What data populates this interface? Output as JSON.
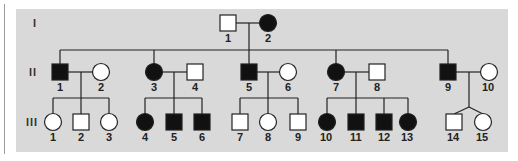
{
  "diagram": {
    "type": "pedigree",
    "colors": {
      "background": "#d9d9d9",
      "affected": "#111111",
      "unaffected": "#ffffff",
      "line": "#222222"
    },
    "generations": [
      {
        "label": "I",
        "y": 23
      },
      {
        "label": "II",
        "y": 72
      },
      {
        "label": "III",
        "y": 122
      }
    ],
    "individuals": [
      {
        "id": "I-1",
        "label": "1",
        "sex": "male",
        "affected": false,
        "x": 228,
        "y": 23
      },
      {
        "id": "I-2",
        "label": "2",
        "sex": "female",
        "affected": true,
        "x": 268,
        "y": 23
      },
      {
        "id": "II-1",
        "label": "1",
        "sex": "male",
        "affected": true,
        "x": 60,
        "y": 72
      },
      {
        "id": "II-2",
        "label": "2",
        "sex": "female",
        "affected": false,
        "x": 101,
        "y": 72
      },
      {
        "id": "II-3",
        "label": "3",
        "sex": "female",
        "affected": true,
        "x": 154,
        "y": 72
      },
      {
        "id": "II-4",
        "label": "4",
        "sex": "male",
        "affected": false,
        "x": 195,
        "y": 72
      },
      {
        "id": "II-5",
        "label": "5",
        "sex": "male",
        "affected": true,
        "x": 249,
        "y": 72
      },
      {
        "id": "II-6",
        "label": "6",
        "sex": "female",
        "affected": false,
        "x": 288,
        "y": 72
      },
      {
        "id": "II-7",
        "label": "7",
        "sex": "female",
        "affected": true,
        "x": 336,
        "y": 72
      },
      {
        "id": "II-8",
        "label": "8",
        "sex": "male",
        "affected": false,
        "x": 377,
        "y": 72
      },
      {
        "id": "II-9",
        "label": "9",
        "sex": "male",
        "affected": true,
        "x": 448,
        "y": 72
      },
      {
        "id": "II-10",
        "label": "10",
        "sex": "female",
        "affected": false,
        "x": 489,
        "y": 72
      },
      {
        "id": "III-1",
        "label": "1",
        "sex": "female",
        "affected": false,
        "x": 53,
        "y": 122
      },
      {
        "id": "III-2",
        "label": "2",
        "sex": "male",
        "affected": false,
        "x": 81,
        "y": 122
      },
      {
        "id": "III-3",
        "label": "3",
        "sex": "female",
        "affected": false,
        "x": 109,
        "y": 122
      },
      {
        "id": "III-4",
        "label": "4",
        "sex": "female",
        "affected": true,
        "x": 145,
        "y": 122
      },
      {
        "id": "III-5",
        "label": "5",
        "sex": "male",
        "affected": true,
        "x": 174,
        "y": 122
      },
      {
        "id": "III-6",
        "label": "6",
        "sex": "male",
        "affected": true,
        "x": 202,
        "y": 122
      },
      {
        "id": "III-7",
        "label": "7",
        "sex": "male",
        "affected": false,
        "x": 240,
        "y": 122
      },
      {
        "id": "III-8",
        "label": "8",
        "sex": "female",
        "affected": false,
        "x": 268,
        "y": 122
      },
      {
        "id": "III-9",
        "label": "9",
        "sex": "male",
        "affected": false,
        "x": 298,
        "y": 122
      },
      {
        "id": "III-10",
        "label": "10",
        "sex": "female",
        "affected": true,
        "x": 327,
        "y": 122
      },
      {
        "id": "III-11",
        "label": "11",
        "sex": "male",
        "affected": true,
        "x": 356,
        "y": 122
      },
      {
        "id": "III-12",
        "label": "12",
        "sex": "male",
        "affected": true,
        "x": 384,
        "y": 122
      },
      {
        "id": "III-13",
        "label": "13",
        "sex": "female",
        "affected": true,
        "x": 408,
        "y": 122
      },
      {
        "id": "III-14",
        "label": "14",
        "sex": "male",
        "affected": false,
        "x": 454,
        "y": 122
      },
      {
        "id": "III-15",
        "label": "15",
        "sex": "female",
        "affected": false,
        "x": 483,
        "y": 122
      }
    ],
    "matings": [
      {
        "partners": [
          "I-1",
          "I-2"
        ],
        "children": [
          "II-1",
          "II-3",
          "II-5",
          "II-7",
          "II-9"
        ]
      },
      {
        "partners": [
          "II-1",
          "II-2"
        ],
        "children": [
          "III-1",
          "III-2",
          "III-3"
        ]
      },
      {
        "partners": [
          "II-3",
          "II-4"
        ],
        "children": [
          "III-4",
          "III-5",
          "III-6"
        ]
      },
      {
        "partners": [
          "II-5",
          "II-6"
        ],
        "children": [
          "III-7",
          "III-8",
          "III-9"
        ]
      },
      {
        "partners": [
          "II-7",
          "II-8"
        ],
        "children": [
          "III-10",
          "III-11",
          "III-12",
          "III-13"
        ]
      },
      {
        "partners": [
          "II-9",
          "II-10"
        ],
        "children": [
          "III-14",
          "III-15"
        ],
        "twins": true
      }
    ]
  }
}
